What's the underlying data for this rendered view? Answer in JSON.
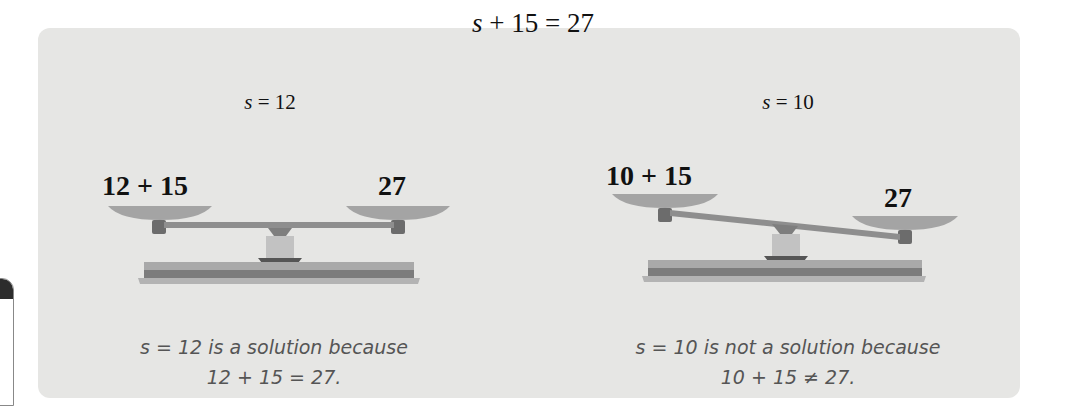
{
  "title": {
    "var": "s",
    "rest": " + 15 = 27"
  },
  "cases": [
    {
      "label_var": "s",
      "label_rest": " = 12",
      "left_pan": "12 + 15",
      "right_pan": "27",
      "balanced": true,
      "caption_line1": "s = 12 is a solution because",
      "caption_line2": "12 + 15 = 27."
    },
    {
      "label_var": "s",
      "label_rest": " = 10",
      "left_pan": "10 + 15",
      "right_pan": "27",
      "balanced": false,
      "caption_line1": "s = 10 is not a solution because",
      "caption_line2": "10 + 15 ≠ 27."
    }
  ],
  "colors": {
    "panel_bg": "#e6e6e4",
    "scale_dark": "#7a7a7a",
    "scale_mid": "#9b9b9b",
    "scale_light": "#b8b8b8",
    "caption_text": "#555555"
  }
}
